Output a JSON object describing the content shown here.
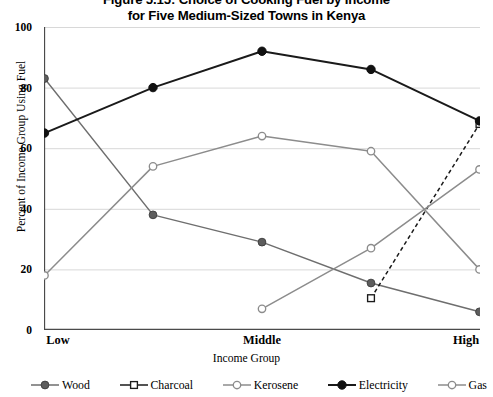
{
  "title": {
    "line1": "Figure 5.15: Choice of Cooking Fuel by Income",
    "line2": "for Five Medium-Sized Towns in Kenya"
  },
  "axes": {
    "ylabel": "Percent of Income Group Using Fuel",
    "xlabel": "Income Group",
    "yticks": [
      "0",
      "20",
      "40",
      "60",
      "80",
      "100"
    ],
    "xticks": [
      "Low",
      "",
      "Middle",
      "",
      "High"
    ]
  },
  "colors": {
    "electricity": "#1a1a1a",
    "wood": "#6e6e6e",
    "kerosene": "#8c8c8c",
    "charcoal": "#1a1a1a",
    "gas": "#8c8c8c",
    "grid": "#d8d8d8",
    "axis": "#4a4a4a",
    "background": "#ffffff"
  },
  "legend": [
    {
      "label": "Wood",
      "marker": "filled-circle-gray",
      "line": "solid"
    },
    {
      "label": "Charcoal",
      "marker": "open-square",
      "line": "solid"
    },
    {
      "label": "Kerosene",
      "marker": "open-circle",
      "line": "solid"
    },
    {
      "label": "Electricity",
      "marker": "filled-circle-black",
      "line": "solid"
    },
    {
      "label": "Gas",
      "marker": "open-circle",
      "line": "solid"
    }
  ],
  "chart_data": {
    "type": "line",
    "title": "Figure 5.15: Choice of Cooking Fuel by Income for Five Medium-Sized Towns in Kenya",
    "xlabel": "Income Group",
    "ylabel": "Percent of Income Group Using Fuel",
    "categories": [
      "Low",
      "",
      "Middle",
      "",
      "High"
    ],
    "x": [
      1,
      2,
      3,
      4,
      5
    ],
    "xlim": [
      1,
      5
    ],
    "ylim": [
      0,
      100
    ],
    "grid": true,
    "legend_position": "bottom",
    "series": [
      {
        "name": "Wood",
        "color": "#6e6e6e",
        "marker": "filled-circle-gray",
        "linestyle": "solid",
        "values": [
          83,
          38,
          29,
          15.5,
          6
        ]
      },
      {
        "name": "Charcoal",
        "color": "#1a1a1a",
        "marker": "open-square",
        "linestyle": "dashed",
        "values": [
          null,
          null,
          null,
          10.5,
          68
        ]
      },
      {
        "name": "Kerosene",
        "color": "#8c8c8c",
        "marker": "open-circle",
        "linestyle": "solid",
        "values": [
          18,
          54,
          64,
          59,
          20
        ]
      },
      {
        "name": "Electricity",
        "color": "#1a1a1a",
        "marker": "filled-circle-black",
        "linestyle": "solid",
        "values": [
          65,
          80,
          92,
          86,
          69
        ]
      },
      {
        "name": "Gas",
        "color": "#8c8c8c",
        "marker": "open-circle",
        "linestyle": "solid",
        "values": [
          null,
          null,
          7,
          27,
          53
        ]
      }
    ]
  }
}
